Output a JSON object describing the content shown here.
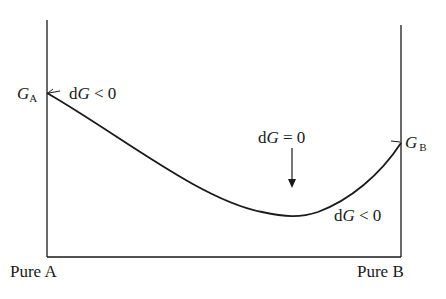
{
  "diagram": {
    "type": "gibbs-energy-vs-composition",
    "labels": {
      "ga_main": "G",
      "ga_sub": "A",
      "gb_main": "G",
      "gb_sub": "B",
      "dg_left_d": "d",
      "dg_left_g": "G",
      "dg_left_rel": " < 0",
      "dg_mid_d": "d",
      "dg_mid_g": "G",
      "dg_mid_rel": " = 0",
      "dg_right_d": "d",
      "dg_right_g": "G",
      "dg_right_rel": " < 0",
      "x_left": "Pure A",
      "x_right": "Pure B"
    },
    "colors": {
      "line": "#1a1a1a",
      "background": "#ffffff"
    }
  }
}
